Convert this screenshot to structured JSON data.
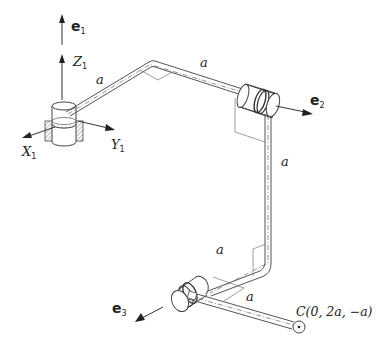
{
  "figure": {
    "labels": {
      "e1": {
        "base": "e",
        "sub": "1"
      },
      "e2": {
        "base": "e",
        "sub": "2"
      },
      "e3": {
        "base": "e",
        "sub": "3"
      },
      "Z1": {
        "base": "Z",
        "sub": "1"
      },
      "X1": {
        "base": "X",
        "sub": "1"
      },
      "Y1": {
        "base": "Y",
        "sub": "1"
      },
      "link_1a": "a",
      "link_1b": "a",
      "link_2": "a",
      "link_3a": "a",
      "link_3b": "a",
      "endpoint": "C(0, 2a, −a)"
    },
    "components": [
      {
        "name": "base-joint",
        "type": "revolute joint in fixed housing",
        "axis": "e1"
      },
      {
        "name": "joint-2",
        "type": "revolute joint",
        "axis": "e2"
      },
      {
        "name": "joint-3",
        "type": "revolute joint",
        "axis": "e3"
      },
      {
        "name": "end-point",
        "type": "point",
        "label": "C"
      }
    ],
    "colors": {
      "line": "#444444",
      "background": "#ffffff"
    }
  }
}
